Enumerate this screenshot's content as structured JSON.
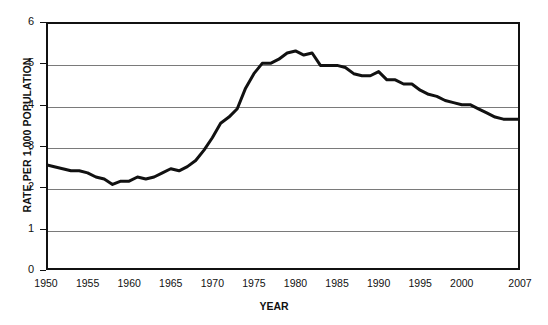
{
  "chart": {
    "type": "line",
    "title": "",
    "xlabel": "YEAR",
    "ylabel": "RATE PER 1,000 POPULATION",
    "line_color": "#111111",
    "grid_color": "#7a7a7a",
    "axis_color": "#111111",
    "background": "#ffffff"
  },
  "chart_data": {
    "type": "line",
    "title": "",
    "xlabel": "YEAR",
    "ylabel": "RATE PER 1,000 POPULATION",
    "xlim": [
      1950,
      2007
    ],
    "ylim": [
      0,
      6
    ],
    "grid": true,
    "legend": "none",
    "xticks": [
      "1950",
      "1955",
      "1960",
      "1965",
      "1970",
      "1975",
      "1980",
      "1985",
      "1990",
      "1995",
      "2000",
      "2007"
    ],
    "xtick_values": [
      1950,
      1955,
      1960,
      1965,
      1970,
      1975,
      1980,
      1985,
      1990,
      1995,
      2000,
      2007
    ],
    "yticks": [
      "0",
      "1",
      "2",
      "3",
      "4",
      "5",
      "6"
    ],
    "ytick_values": [
      0,
      1,
      2,
      3,
      4,
      5,
      6
    ],
    "series": [
      {
        "name": "Rate per 1,000 population",
        "x": [
          1950,
          1951,
          1952,
          1953,
          1954,
          1955,
          1956,
          1957,
          1958,
          1959,
          1960,
          1961,
          1962,
          1963,
          1964,
          1965,
          1966,
          1967,
          1968,
          1969,
          1970,
          1971,
          1972,
          1973,
          1974,
          1975,
          1976,
          1977,
          1978,
          1979,
          1980,
          1981,
          1982,
          1983,
          1984,
          1985,
          1986,
          1987,
          1988,
          1989,
          1990,
          1991,
          1992,
          1993,
          1994,
          1995,
          1996,
          1997,
          1998,
          1999,
          2000,
          2001,
          2002,
          2003,
          2004,
          2005,
          2006,
          2007
        ],
        "y": [
          2.55,
          2.5,
          2.45,
          2.4,
          2.4,
          2.35,
          2.25,
          2.2,
          2.07,
          2.15,
          2.15,
          2.25,
          2.2,
          2.25,
          2.35,
          2.45,
          2.4,
          2.5,
          2.65,
          2.9,
          3.2,
          3.55,
          3.7,
          3.9,
          4.4,
          4.75,
          5.0,
          5.0,
          5.1,
          5.25,
          5.3,
          5.2,
          5.25,
          4.95,
          4.95,
          4.95,
          4.9,
          4.75,
          4.7,
          4.7,
          4.8,
          4.6,
          4.6,
          4.5,
          4.5,
          4.35,
          4.25,
          4.2,
          4.1,
          4.05,
          4.0,
          4.0,
          3.9,
          3.8,
          3.7,
          3.65,
          3.65,
          3.65
        ]
      }
    ]
  }
}
